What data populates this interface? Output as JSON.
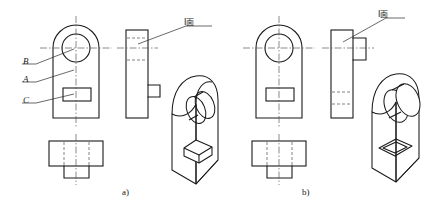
{
  "figure": {
    "title": "",
    "captions": [
      {
        "id": "a",
        "text": "a)",
        "x": 122,
        "y": 190
      },
      {
        "id": "b",
        "text": "b)",
        "x": 302,
        "y": 190
      }
    ]
  },
  "panel_a": {
    "id": "a",
    "surface_labels": [
      {
        "key": "B",
        "text": "B",
        "x": 24,
        "y": 58
      },
      {
        "key": "A",
        "text": "A",
        "x": 24,
        "y": 76
      },
      {
        "key": "C",
        "text": "C",
        "x": 24,
        "y": 97
      }
    ],
    "feature_label": {
      "text": "I面",
      "x": 184,
      "y": 20
    },
    "front_view": {
      "name": "front-view",
      "hole_label": "circular-through-hole",
      "slot_label": "rectangular-slot"
    },
    "side_view": {
      "name": "side-view",
      "protrusion": "lower-right-boss"
    },
    "top_view": {
      "name": "top-view"
    },
    "iso_view": {
      "name": "isometric-view",
      "features": [
        "through-hole",
        "raised-rectangular-boss"
      ]
    }
  },
  "panel_b": {
    "id": "b",
    "surface_labels": [],
    "feature_label": {
      "text": "I面",
      "x": 369,
      "y": 12
    },
    "front_view": {
      "name": "front-view",
      "hole_label": "circular-through-hole",
      "slot_label": "rectangular-slot"
    },
    "side_view": {
      "name": "side-view",
      "protrusion": "upper-right-cylindrical-boss"
    },
    "top_view": {
      "name": "top-view"
    },
    "iso_view": {
      "name": "isometric-view",
      "features": [
        "protruding-cylindrical-boss",
        "recessed-rectangular-groove"
      ]
    }
  },
  "style": {
    "line_color": "#1a1a1a",
    "hidden_color": "#5a5a5a",
    "center_color": "#4a4a4a",
    "background": "#ffffff"
  }
}
